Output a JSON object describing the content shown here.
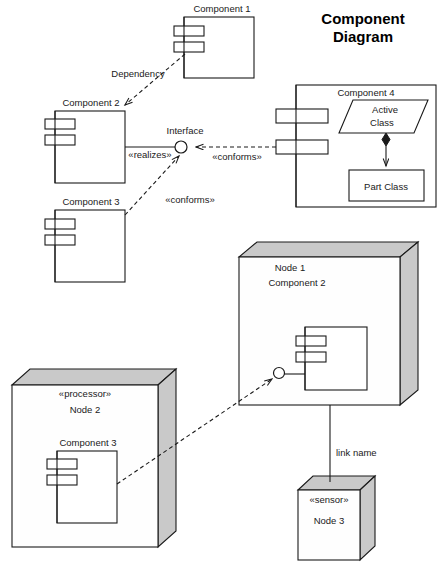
{
  "diagram": {
    "title_line1": "Component",
    "title_line2": "Diagram",
    "kind": "uml-component-diagram"
  },
  "components": {
    "component1": {
      "label": "Component 1"
    },
    "component2": {
      "label": "Component 2"
    },
    "component3": {
      "label": "Component 3"
    },
    "component4": {
      "label": "Component 4"
    },
    "active_class": {
      "label_line1": "Active",
      "label_line2": "Class"
    },
    "part_class": {
      "label": "Part Class"
    },
    "node1_component2": {
      "label": "Component 2"
    },
    "node2_component3": {
      "label": "Component 3"
    }
  },
  "nodes": {
    "node1": {
      "name": "Node 1",
      "stereotype": ""
    },
    "node2": {
      "name": "Node 2",
      "stereotype": "«processor»"
    },
    "node3": {
      "name": "Node 3",
      "stereotype": "«sensor»"
    }
  },
  "connectors": {
    "dependency": {
      "label": "Dependency"
    },
    "interface": {
      "label": "Interface"
    },
    "realizes": {
      "label": "«realizes»"
    },
    "conforms_right": {
      "label": "«conforms»"
    },
    "conforms_lower": {
      "label": "«conforms»"
    },
    "link_name": {
      "label": "link name"
    }
  },
  "colors": {
    "stroke": "#1a1a1a",
    "fill": "#ffffff",
    "node_3d_face": "#c9c9c9",
    "title": "#000000"
  }
}
